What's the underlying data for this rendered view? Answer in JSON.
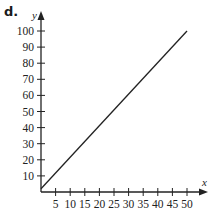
{
  "figure": {
    "label": "d."
  },
  "chart_data": {
    "type": "line",
    "title": "",
    "xlabel": "x",
    "ylabel": "y",
    "xlim": [
      0,
      52
    ],
    "ylim": [
      0,
      105
    ],
    "grid": false,
    "legend": null,
    "x_ticks": [
      5,
      10,
      15,
      20,
      25,
      30,
      35,
      40,
      45,
      50
    ],
    "y_ticks": [
      10,
      20,
      30,
      40,
      50,
      60,
      70,
      80,
      90,
      100
    ],
    "series": [
      {
        "name": "line",
        "x": [
          0,
          50
        ],
        "y": [
          2,
          100
        ],
        "color": "#222222"
      }
    ]
  }
}
